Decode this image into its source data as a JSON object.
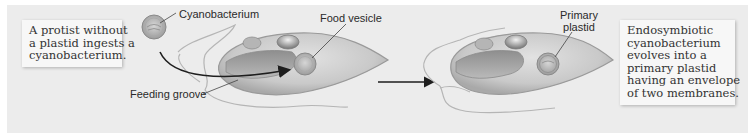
{
  "diagram": {
    "background_color": "#ececec",
    "boxes": {
      "left": {
        "lines": [
          "A protist without",
          "a plastid ingests a",
          "cyanobacterium."
        ]
      },
      "right": {
        "lines": [
          "Endosymbiotic",
          "cyanobacterium",
          "evolves into a",
          "primary plastid",
          "having an envelope",
          "of two membranes."
        ]
      }
    },
    "labels": {
      "cyanobacterium": "Cyanobacterium",
      "food_vesicle": "Food vesicle",
      "feeding_groove": "Feeding groove",
      "primary_plastid_line1": "Primary",
      "primary_plastid_line2": "plastid"
    },
    "stages": [
      {
        "name": "ingestion",
        "elements": [
          "cyanobacterium",
          "protist cell",
          "feeding groove",
          "food vesicle"
        ]
      },
      {
        "name": "endosymbiosis",
        "elements": [
          "protist cell",
          "primary plastid"
        ]
      }
    ],
    "arrows": [
      "curved ingestion arrow",
      "transition arrow between stages"
    ]
  }
}
